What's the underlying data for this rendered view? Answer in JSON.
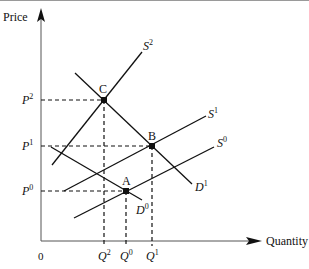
{
  "diagram": {
    "type": "supply-demand",
    "axes": {
      "y_label": "Price",
      "x_label": "Quantity",
      "origin_label": "0"
    },
    "price_levels": [
      {
        "id": "P2",
        "base": "P",
        "sup": "2",
        "y": 100
      },
      {
        "id": "P1",
        "base": "P",
        "sup": "1",
        "y": 146
      },
      {
        "id": "P0",
        "base": "P",
        "sup": "0",
        "y": 191
      }
    ],
    "quantity_levels": [
      {
        "id": "Q2",
        "base": "Q",
        "sup": "2",
        "x": 104
      },
      {
        "id": "Q0",
        "base": "Q",
        "sup": "0",
        "x": 126
      },
      {
        "id": "Q1",
        "base": "Q",
        "sup": "1",
        "x": 152
      }
    ],
    "curves": [
      {
        "id": "S2",
        "base": "S",
        "sup": "2",
        "kind": "supply"
      },
      {
        "id": "S1",
        "base": "S",
        "sup": "1",
        "kind": "supply"
      },
      {
        "id": "S0",
        "base": "S",
        "sup": "0",
        "kind": "supply"
      },
      {
        "id": "D1",
        "base": "D",
        "sup": "1",
        "kind": "demand"
      },
      {
        "id": "D0",
        "base": "D",
        "sup": "0",
        "kind": "demand"
      }
    ],
    "equilibria": [
      {
        "label": "C",
        "price": "P2",
        "quantity": "Q2"
      },
      {
        "label": "B",
        "price": "P1",
        "quantity": "Q1"
      },
      {
        "label": "A",
        "price": "P0",
        "quantity": "Q0"
      }
    ],
    "colors": {
      "line": "#111111",
      "background": "#ffffff"
    }
  }
}
